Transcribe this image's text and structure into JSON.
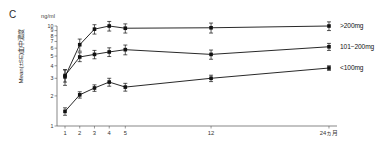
{
  "panel": {
    "label": "C"
  },
  "axes": {
    "y_unit": "ng/ml",
    "y_title": "Mean(±SE)血中濃度",
    "y_ticks": [
      "1",
      "2",
      "3",
      "4",
      "5",
      "6",
      "7",
      "8",
      "9",
      "10"
    ],
    "x_ticks": [
      "1",
      "2",
      "3",
      "4",
      "5",
      "12",
      "24ヵ月"
    ]
  },
  "legend": {
    "items": [
      {
        "label": ">200mg"
      },
      {
        "label": "101−200mg"
      },
      {
        "label": "<100mg"
      }
    ]
  },
  "chart_data": {
    "type": "line",
    "title": "",
    "subtitle": "",
    "panel_label": "C",
    "xlabel": "",
    "ylabel": "Mean(±SE)血中濃度",
    "y_unit": "ng/ml",
    "yscale": "log",
    "ylim": [
      1,
      10
    ],
    "y_ticks": [
      1,
      2,
      3,
      4,
      5,
      6,
      7,
      8,
      9,
      10
    ],
    "x": [
      1,
      2,
      3,
      4,
      5,
      12,
      24
    ],
    "x_tick_labels": [
      "1",
      "2",
      "3",
      "4",
      "5",
      "12",
      "24ヵ月"
    ],
    "x_axis_spacing": "non-linear (categorical-like: 1-5 closely spaced, then 12, then 24)",
    "grid": false,
    "legend_position": "right, inline at line ends",
    "marker": "filled-square",
    "error_bars": "SE, vertical caps",
    "series": [
      {
        "name": ">200mg",
        "values": [
          3.1,
          6.5,
          9.3,
          10.0,
          9.5,
          9.6,
          10.0
        ],
        "errors": [
          0.55,
          0.9,
          1.0,
          1.1,
          1.0,
          1.1,
          1.0
        ]
      },
      {
        "name": "101−200mg",
        "values": [
          3.2,
          4.9,
          5.2,
          5.5,
          5.8,
          5.2,
          6.2
        ],
        "errors": [
          0.45,
          0.5,
          0.5,
          0.55,
          0.65,
          0.55,
          0.5
        ]
      },
      {
        "name": "<100mg",
        "values": [
          1.4,
          2.05,
          2.4,
          2.75,
          2.45,
          3.0,
          3.8
        ],
        "errors": [
          0.12,
          0.15,
          0.18,
          0.25,
          0.22,
          0.22,
          0.2
        ]
      }
    ]
  }
}
